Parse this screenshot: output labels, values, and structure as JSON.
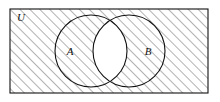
{
  "figure": {
    "kind": "venn-diagram",
    "title": ""
  },
  "labels": {
    "universe": "U",
    "set_a": "A",
    "set_b": "B"
  },
  "colors": {
    "stroke": "#111111",
    "hatch": "#555555",
    "fill_shaded": "#ffffff",
    "fill_unshaded": "#ffffff",
    "background": "#ffffff"
  },
  "geometry": {
    "canvas": {
      "width": 220,
      "height": 102
    },
    "rectangle": {
      "x": 10,
      "y": 9,
      "width": 198,
      "height": 84
    },
    "circle_a": {
      "cx": 91,
      "cy": 51,
      "r": 36
    },
    "circle_b": {
      "cx": 129,
      "cy": 51,
      "r": 36
    },
    "label_positions": {
      "universe": {
        "x": 17,
        "y": 21
      },
      "set_a": {
        "x": 70,
        "y": 55
      },
      "set_b": {
        "x": 144,
        "y": 55
      }
    },
    "hatch": {
      "angle_deg": 45,
      "spacing": 7,
      "stroke_width": 0.9
    }
  },
  "shading": {
    "shaded_region_name": "complement-of-intersection",
    "unshaded_region_name": "intersection-lens"
  }
}
